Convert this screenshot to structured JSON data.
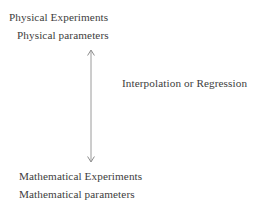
{
  "diagram": {
    "type": "two-way-arrow-flow",
    "background_color": "#ffffff",
    "text_color": "#3d3d3d",
    "top_block": {
      "line1": "Physical Experiments",
      "line2": "Physical parameters"
    },
    "bottom_block": {
      "line1": "Mathematical Experiments",
      "line2": "Mathematical parameters"
    },
    "connector": {
      "label": "Interpolation or Regression",
      "arrow_name": "double-headed-vertical-arrow",
      "color": "#8c8c8c",
      "direction": "bidirectional"
    }
  }
}
